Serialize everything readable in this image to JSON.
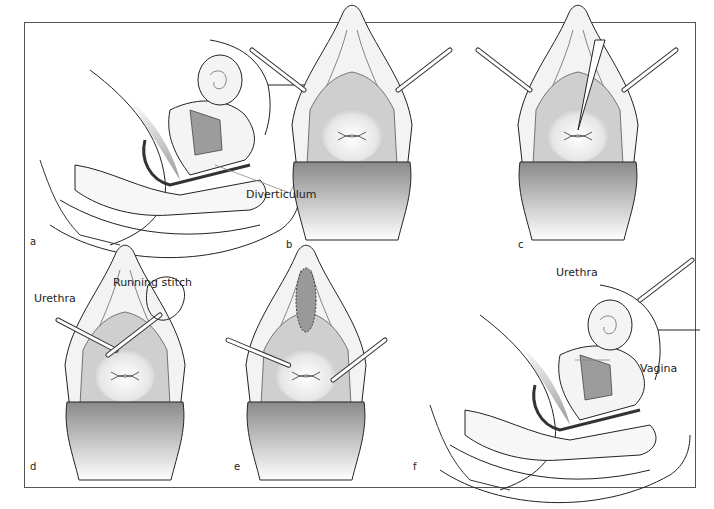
{
  "figure": {
    "panels": [
      {
        "id": "a",
        "label": "a",
        "view": "sagittal-section"
      },
      {
        "id": "b",
        "label": "b",
        "view": "perineal-speculum"
      },
      {
        "id": "c",
        "label": "c",
        "view": "perineal-speculum-incision"
      },
      {
        "id": "d",
        "label": "d",
        "view": "perineal-running-stitch"
      },
      {
        "id": "e",
        "label": "e",
        "view": "perineal-closed"
      },
      {
        "id": "f",
        "label": "f",
        "view": "sagittal-section-repaired"
      }
    ],
    "annotations": {
      "diverticulum": "Diverticulum",
      "running_stitch": "Running stitch",
      "urethra_d": "Urethra",
      "urethra_f": "Urethra",
      "vagina": "Vagina"
    },
    "colors": {
      "line": "#222222",
      "leader": "#888888",
      "tissue": "#f2f2f2",
      "shade": "#9a9a9a",
      "speculum": "#8a8a8a"
    }
  }
}
